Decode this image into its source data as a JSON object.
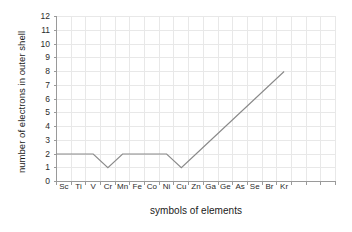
{
  "chart_data": {
    "type": "line",
    "title": "",
    "xlabel": "symbols of elements",
    "ylabel": "number of electrons in outer shell",
    "categories": [
      "Sc",
      "Ti",
      "V",
      "Cr",
      "Mn",
      "Fe",
      "Co",
      "Ni",
      "Cu",
      "Zn",
      "Ga",
      "Ge",
      "As",
      "Se",
      "Br",
      "Kr"
    ],
    "values": [
      2,
      2,
      2,
      1,
      2,
      2,
      2,
      2,
      1,
      2,
      3,
      4,
      5,
      6,
      7,
      8
    ],
    "ylim": [
      0,
      12
    ],
    "yticks": [
      0,
      1,
      2,
      3,
      4,
      5,
      6,
      7,
      8,
      9,
      10,
      11,
      12
    ],
    "ytick_labels": [
      "0",
      "1",
      "2",
      "3",
      "4",
      "5",
      "6",
      "7",
      "8",
      "9",
      "10",
      "11",
      "12"
    ],
    "grid": true,
    "legend": "none",
    "line_color": "#8a8a8a",
    "grid_color": "#e8e8e8",
    "axis_color": "#9a9a9a",
    "text_color": "#1a1a1a",
    "extra_unlabeled_xticks": 3
  }
}
